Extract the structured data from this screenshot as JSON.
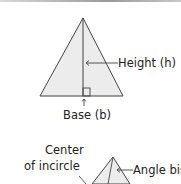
{
  "diagram": {
    "triangle_height": {
      "height_label": "Height (h)",
      "base_label": "Base (b)",
      "fill_color": "#ececec",
      "stroke_color": "#444444"
    },
    "triangle_incircle": {
      "center_label_line1": "Center",
      "center_label_line2": "of incircle",
      "bisector_label": "Angle bisector"
    }
  }
}
